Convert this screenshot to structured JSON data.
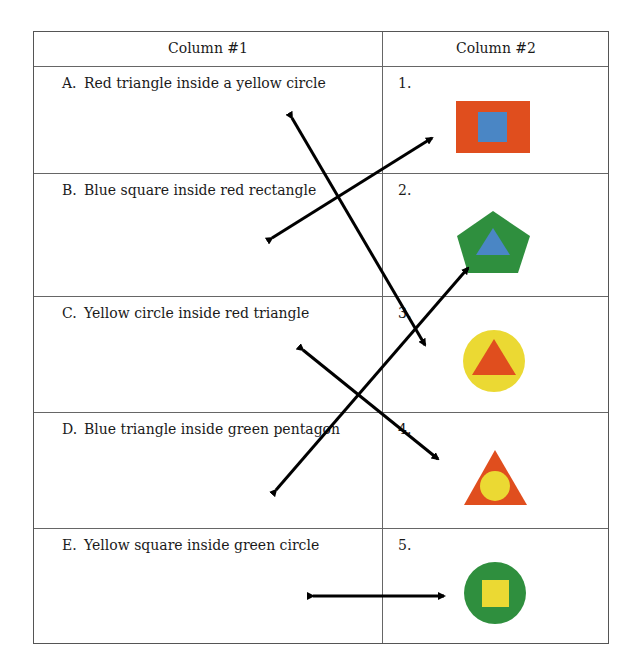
{
  "table": {
    "headers": [
      "Column #1",
      "Column #2"
    ],
    "rows": [
      {
        "letter": "A.",
        "text": "Red triangle inside a yellow circle",
        "number": "1.",
        "shape": "blue-square-in-red-rectangle"
      },
      {
        "letter": "B.",
        "text": "Blue square inside red rectangle",
        "number": "2.",
        "shape": "blue-triangle-in-green-pentagon"
      },
      {
        "letter": "C.",
        "text": "Yellow circle inside red triangle",
        "number": "3.",
        "shape": "red-triangle-in-yellow-circle"
      },
      {
        "letter": "D.",
        "text": "Blue triangle inside green pentagon",
        "number": "4.",
        "shape": "yellow-circle-in-red-triangle"
      },
      {
        "letter": "E.",
        "text": "Yellow square inside green circle",
        "number": "5.",
        "shape": "yellow-square-in-green-circle"
      }
    ]
  },
  "matches": [
    {
      "from": "A",
      "to": "3"
    },
    {
      "from": "B",
      "to": "1"
    },
    {
      "from": "C",
      "to": "4"
    },
    {
      "from": "D",
      "to": "2"
    },
    {
      "from": "E",
      "to": "5"
    }
  ],
  "colors": {
    "red": "#e04e1e",
    "blue": "#4a86c5",
    "green": "#2f8f3e",
    "yellow": "#ebd933",
    "border": "#666666",
    "arrow": "#000000"
  }
}
